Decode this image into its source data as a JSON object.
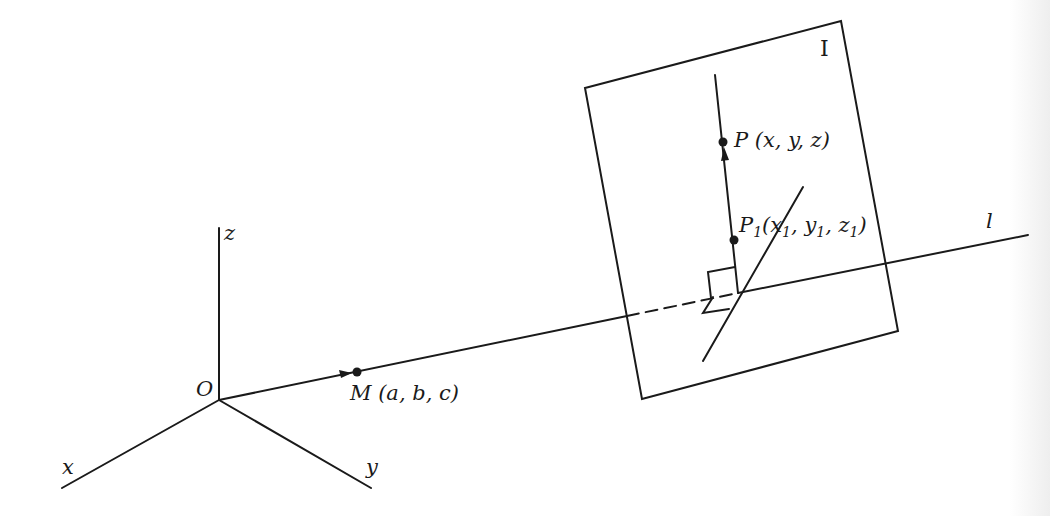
{
  "diagram": {
    "type": "3d-geometry",
    "colors": {
      "ink": "#1a1a1a",
      "background": "#ffffff"
    },
    "labels": {
      "origin": "O",
      "axis_x": "x",
      "axis_y": "y",
      "axis_z": "z",
      "point_m": "M (a, b, c)",
      "point_p": "P (x, y, z)",
      "point_p1_main": "P",
      "point_p1_sub": "1",
      "point_p1_coords_open": "(x",
      "point_p1_coords_x_sub": "1",
      "point_p1_coords_y": ", y",
      "point_p1_coords_y_sub": "1",
      "point_p1_coords_z": ", z",
      "point_p1_coords_z_sub": "1",
      "point_p1_coords_close": ")",
      "line_l": "l",
      "plane": "I"
    },
    "points": {
      "O": [
        219,
        400
      ],
      "M": [
        357,
        372
      ],
      "P": [
        723,
        142
      ],
      "P1": [
        734,
        240
      ],
      "foot": [
        738,
        293
      ]
    },
    "axes": {
      "z_end": [
        219,
        228
      ],
      "x_end": [
        62,
        488
      ],
      "y_end": [
        371,
        488
      ]
    },
    "line_l": {
      "start": [
        219,
        400
      ],
      "end": [
        1028,
        235
      ],
      "dashed_from": [
        627,
        316
      ],
      "dashed_to": [
        738,
        293
      ]
    },
    "plane_corners": [
      [
        585,
        88
      ],
      [
        841,
        21
      ],
      [
        898,
        331
      ],
      [
        642,
        399
      ]
    ]
  }
}
